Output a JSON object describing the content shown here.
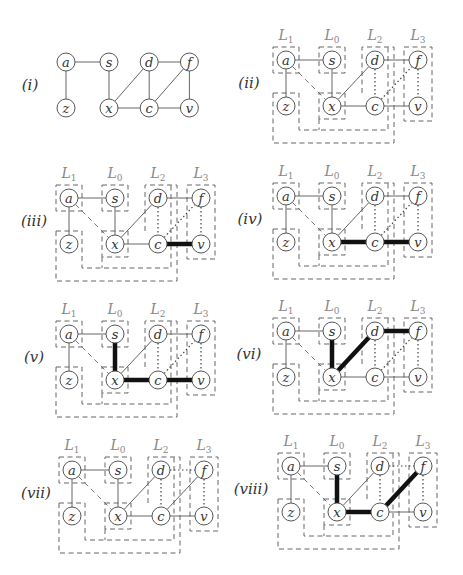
{
  "figure": {
    "nodes": {
      "a": [
        0,
        0
      ],
      "s": [
        46,
        0
      ],
      "d": [
        89,
        0
      ],
      "f": [
        132,
        0
      ],
      "z": [
        0,
        46
      ],
      "x": [
        46,
        46
      ],
      "c": [
        89,
        46
      ],
      "v": [
        132,
        46
      ]
    },
    "levels": [
      {
        "name": "L",
        "sub": "1",
        "dx": 0
      },
      {
        "name": "L",
        "sub": "0",
        "dx": 46
      },
      {
        "name": "L",
        "sub": "2",
        "dx": 89
      },
      {
        "name": "L",
        "sub": "3",
        "dx": 132
      }
    ],
    "panels": [
      {
        "label": "(i)",
        "origin": [
          66,
          62
        ],
        "label_pos": [
          30,
          85
        ],
        "show_levels": false,
        "edges": [
          [
            "a",
            "s",
            "solid"
          ],
          [
            "a",
            "z",
            "solid"
          ],
          [
            "s",
            "x",
            "solid"
          ],
          [
            "x",
            "d",
            "solid"
          ],
          [
            "x",
            "c",
            "solid"
          ],
          [
            "d",
            "c",
            "solid"
          ],
          [
            "d",
            "f",
            "solid"
          ],
          [
            "c",
            "f",
            "solid"
          ],
          [
            "c",
            "v",
            "solid"
          ],
          [
            "f",
            "v",
            "solid"
          ]
        ]
      },
      {
        "label": "(ii)",
        "origin": [
          286,
          60
        ],
        "label_pos": [
          249,
          83
        ],
        "show_levels": true,
        "edges": [
          [
            "a",
            "s",
            "solid"
          ],
          [
            "a",
            "z",
            "solid"
          ],
          [
            "a",
            "x",
            "dashed"
          ],
          [
            "s",
            "x",
            "solid"
          ],
          [
            "x",
            "d",
            "solid"
          ],
          [
            "x",
            "c",
            "solid"
          ],
          [
            "d",
            "c",
            "dotted"
          ],
          [
            "d",
            "f",
            "solid"
          ],
          [
            "c",
            "f",
            "dotted"
          ],
          [
            "c",
            "v",
            "solid"
          ],
          [
            "f",
            "v",
            "dotted"
          ]
        ]
      },
      {
        "label": "(iii)",
        "origin": [
          69,
          198
        ],
        "label_pos": [
          34,
          221
        ],
        "show_levels": true,
        "edges": [
          [
            "a",
            "s",
            "solid"
          ],
          [
            "a",
            "z",
            "solid"
          ],
          [
            "a",
            "x",
            "dashed"
          ],
          [
            "s",
            "x",
            "solid"
          ],
          [
            "x",
            "d",
            "solid"
          ],
          [
            "x",
            "c",
            "solid"
          ],
          [
            "d",
            "c",
            "dotted"
          ],
          [
            "d",
            "f",
            "solid"
          ],
          [
            "c",
            "f",
            "dotted"
          ],
          [
            "c",
            "v",
            "bold"
          ],
          [
            "f",
            "v",
            "dotted"
          ]
        ]
      },
      {
        "label": "(iv)",
        "origin": [
          286,
          196
        ],
        "label_pos": [
          250,
          219
        ],
        "show_levels": true,
        "edges": [
          [
            "a",
            "s",
            "solid"
          ],
          [
            "a",
            "z",
            "solid"
          ],
          [
            "a",
            "x",
            "dashed"
          ],
          [
            "s",
            "x",
            "solid"
          ],
          [
            "x",
            "d",
            "solid"
          ],
          [
            "x",
            "c",
            "bold"
          ],
          [
            "d",
            "c",
            "dotted"
          ],
          [
            "d",
            "f",
            "solid"
          ],
          [
            "c",
            "f",
            "dotted"
          ],
          [
            "c",
            "v",
            "bold"
          ],
          [
            "f",
            "v",
            "dotted"
          ]
        ]
      },
      {
        "label": "(v)",
        "origin": [
          69,
          334
        ],
        "label_pos": [
          34,
          357
        ],
        "show_levels": true,
        "edges": [
          [
            "a",
            "s",
            "solid"
          ],
          [
            "a",
            "z",
            "solid"
          ],
          [
            "a",
            "x",
            "dashed"
          ],
          [
            "s",
            "x",
            "bold"
          ],
          [
            "x",
            "d",
            "solid"
          ],
          [
            "x",
            "c",
            "bold"
          ],
          [
            "d",
            "c",
            "dotted"
          ],
          [
            "d",
            "f",
            "solid"
          ],
          [
            "c",
            "f",
            "dotted"
          ],
          [
            "c",
            "v",
            "bold"
          ],
          [
            "f",
            "v",
            "dotted"
          ]
        ]
      },
      {
        "label": "(vi)",
        "origin": [
          286,
          331
        ],
        "label_pos": [
          249,
          354
        ],
        "show_levels": true,
        "edges": [
          [
            "a",
            "s",
            "solid"
          ],
          [
            "a",
            "z",
            "solid"
          ],
          [
            "a",
            "x",
            "dashed"
          ],
          [
            "s",
            "x",
            "bold"
          ],
          [
            "x",
            "d",
            "bold"
          ],
          [
            "x",
            "c",
            "solid"
          ],
          [
            "d",
            "c",
            "dotted"
          ],
          [
            "d",
            "f",
            "bold"
          ],
          [
            "c",
            "f",
            "dotted"
          ],
          [
            "c",
            "v",
            "solid"
          ],
          [
            "f",
            "v",
            "dotted"
          ]
        ]
      },
      {
        "label": "(vii)",
        "origin": [
          72,
          470
        ],
        "label_pos": [
          36,
          493
        ],
        "show_levels": true,
        "edges": [
          [
            "a",
            "s",
            "solid"
          ],
          [
            "a",
            "z",
            "solid"
          ],
          [
            "a",
            "x",
            "dashed"
          ],
          [
            "s",
            "x",
            "solid"
          ],
          [
            "x",
            "d",
            "solid"
          ],
          [
            "x",
            "c",
            "solid"
          ],
          [
            "d",
            "c",
            "dotted"
          ],
          [
            "d",
            "f",
            "dotted"
          ],
          [
            "c",
            "f",
            "solid"
          ],
          [
            "c",
            "v",
            "solid"
          ],
          [
            "f",
            "v",
            "dotted"
          ]
        ]
      },
      {
        "label": "(viii)",
        "origin": [
          291,
          466
        ],
        "label_pos": [
          251,
          489
        ],
        "show_levels": true,
        "edges": [
          [
            "a",
            "s",
            "solid"
          ],
          [
            "a",
            "z",
            "solid"
          ],
          [
            "a",
            "x",
            "dashed"
          ],
          [
            "s",
            "x",
            "bold"
          ],
          [
            "x",
            "d",
            "solid"
          ],
          [
            "x",
            "c",
            "bold"
          ],
          [
            "d",
            "c",
            "dotted"
          ],
          [
            "d",
            "f",
            "dotted"
          ],
          [
            "c",
            "f",
            "bold"
          ],
          [
            "c",
            "v",
            "solid"
          ],
          [
            "f",
            "v",
            "dotted"
          ]
        ]
      }
    ]
  }
}
